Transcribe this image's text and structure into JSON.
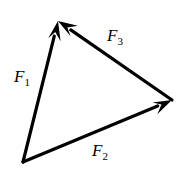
{
  "figure": {
    "kind": "force-triangle-vector-diagram",
    "background_color": "#ffffff",
    "stroke_color": "#000000",
    "width": 192,
    "height": 182
  },
  "chart_data": {
    "type": "diagram",
    "title": "",
    "xlabel": "",
    "ylabel": "",
    "vertices": {
      "apex": [
        58,
        21
      ],
      "bottom_left": [
        23,
        162
      ],
      "right": [
        172,
        100
      ]
    },
    "vectors": [
      {
        "name": "F1",
        "label": "F",
        "subscript": "1",
        "from": [
          23,
          162
        ],
        "to": [
          58,
          21
        ],
        "arrow_at": "to",
        "label_position": [
          14,
          68
        ]
      },
      {
        "name": "F2",
        "label": "F",
        "subscript": "2",
        "from": [
          23,
          162
        ],
        "to": [
          172,
          100
        ],
        "arrow_at": "to",
        "label_position": [
          92,
          142
        ]
      },
      {
        "name": "F3",
        "label": "F",
        "subscript": "3",
        "from": [
          172,
          100
        ],
        "to": [
          58,
          21
        ],
        "arrow_at": "to",
        "label_position": [
          107,
          27
        ]
      }
    ],
    "stroke_width": 3.2,
    "grid": false,
    "legend": false
  }
}
